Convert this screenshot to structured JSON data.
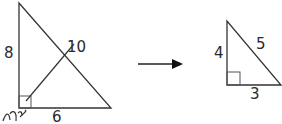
{
  "diagram": {
    "left_triangle": {
      "side_vertical": "8",
      "side_horizontal": "6",
      "hypotenuse": "10",
      "handwritten_note": "ഩ"
    },
    "arrow": {
      "direction": "right"
    },
    "right_triangle": {
      "side_vertical": "4",
      "side_horizontal": "3",
      "hypotenuse": "5"
    },
    "colors": {
      "stroke": "#333333",
      "background": "#ffffff"
    }
  }
}
